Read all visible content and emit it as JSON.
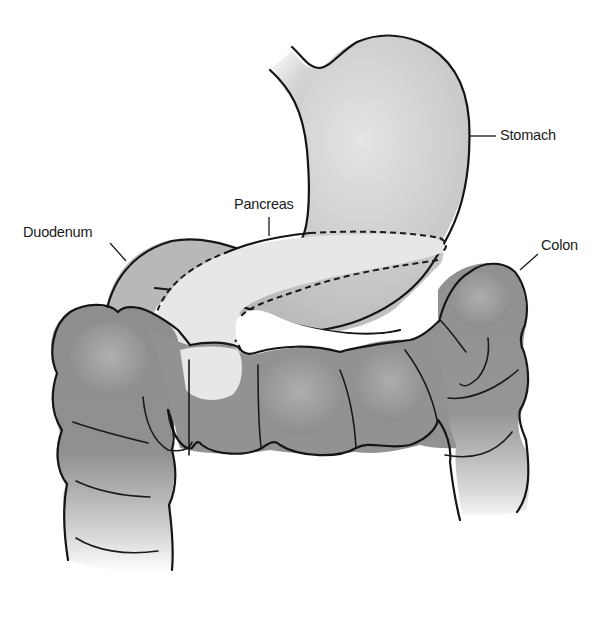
{
  "diagram": {
    "labels": {
      "stomach": "Stomach",
      "pancreas": "Pancreas",
      "duodenum": "Duodenum",
      "colon": "Colon"
    },
    "colors": {
      "stomach_fill": "#c4c4c4",
      "stomach_highlight": "#e2e2e2",
      "duodenum_fill": "#b5b5b5",
      "pancreas_fill": "#e6e6e6",
      "colon_fill": "#8f8f8f",
      "colon_highlight": "#b0b0b0",
      "outline": "#151515",
      "background": "#ffffff"
    }
  }
}
